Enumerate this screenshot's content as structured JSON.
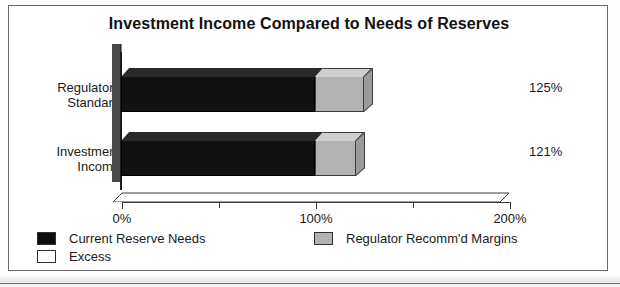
{
  "chart_data": {
    "type": "bar",
    "orientation": "horizontal",
    "stacked": true,
    "style": "3d",
    "title": "Investment Income Compared to Needs of Reserves",
    "xlabel": "",
    "ylabel": "",
    "categories": [
      "Regulatory Standard",
      "Investment Income"
    ],
    "category_lines": [
      [
        "Regulatory",
        "Standard"
      ],
      [
        "Investment",
        "Income"
      ]
    ],
    "series": [
      {
        "name": "Current Reserve Needs",
        "color": "#111111",
        "values": [
          100,
          100
        ],
        "unit": "%"
      },
      {
        "name": "Regulator Recomm'd Margins",
        "color": "#b2b2b2",
        "values": [
          25,
          21
        ],
        "unit": "%"
      }
    ],
    "totals": [
      125,
      121
    ],
    "data_labels": [
      "125%",
      "121%"
    ],
    "xlim": [
      0,
      200
    ],
    "xticks": [
      0,
      50,
      100,
      150,
      200
    ],
    "xtick_labels": [
      "0%",
      "",
      "100%",
      "",
      "200%"
    ],
    "xtick_major": [
      0,
      100,
      200
    ],
    "xtick_minor": [
      50,
      150
    ],
    "grid": false,
    "legend_position": "bottom",
    "legend": [
      {
        "label": "Current Reserve Needs",
        "swatch": "black"
      },
      {
        "label": "Excess",
        "swatch": "white"
      },
      {
        "label": "Regulator Recomm'd Margins",
        "swatch": "gray"
      }
    ]
  },
  "colors": {
    "bar_primary": "#111111",
    "bar_secondary": "#b2b2b2",
    "bar_secondary_top": "#cfcfcf",
    "bar_secondary_side": "#9a9a9a",
    "wall": "#4a4a4a",
    "border": "#6a6a6a",
    "text": "#1a1a1a"
  }
}
